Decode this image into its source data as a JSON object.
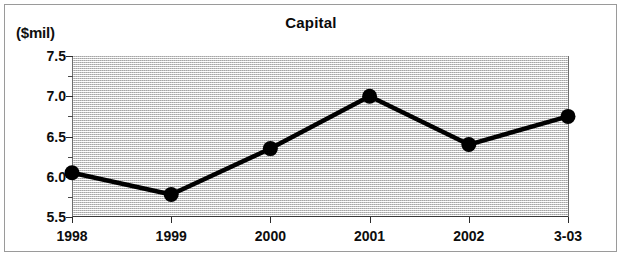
{
  "chart_data": {
    "type": "line",
    "title": "Capital",
    "unit_label": "($mil)",
    "xlabel": "",
    "ylabel": "($mil)",
    "categories": [
      "1998",
      "1999",
      "2000",
      "2001",
      "2002",
      "3-03"
    ],
    "values": [
      6.05,
      5.78,
      6.35,
      7.0,
      6.4,
      6.75
    ],
    "series": [
      {
        "name": "Capital",
        "values": [
          6.05,
          5.78,
          6.35,
          7.0,
          6.4,
          6.75
        ]
      }
    ],
    "ylim": [
      5.5,
      7.5
    ],
    "y_ticks": [
      5.5,
      6.0,
      6.5,
      7.0,
      7.5
    ],
    "y_tick_labels": [
      "5.5",
      "6.0",
      "6.5",
      "7.0",
      "7.5"
    ],
    "y_minor_ticks": [
      5.75,
      6.25,
      6.75,
      7.25
    ],
    "grid": false,
    "legend": "none",
    "marker": "filled-circle",
    "line_color": "#000000",
    "plot_background": "#dcdcdc"
  }
}
